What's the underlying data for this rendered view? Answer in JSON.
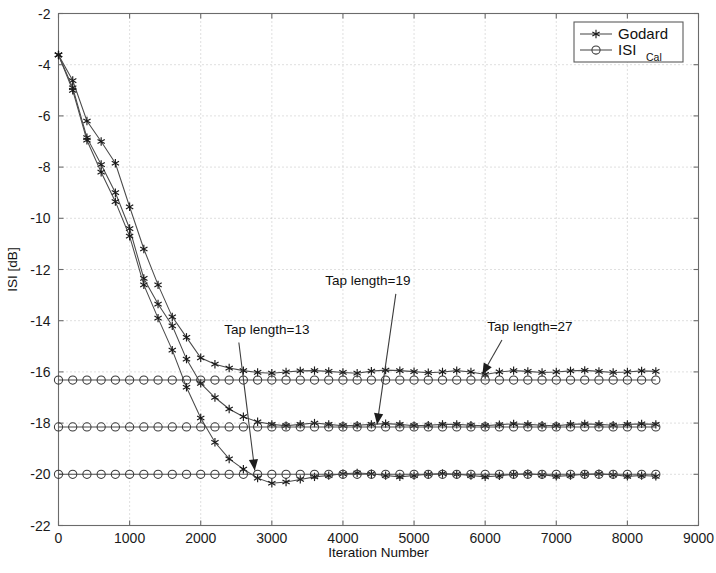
{
  "chart_data": {
    "type": "line",
    "title": "",
    "xlabel": "Iteration Number",
    "ylabel": "ISI [dB]",
    "xlim": [
      0,
      9000
    ],
    "ylim": [
      -22,
      -2
    ],
    "xticks": [
      0,
      1000,
      2000,
      3000,
      4000,
      5000,
      6000,
      7000,
      8000,
      9000
    ],
    "yticks": [
      -2,
      -4,
      -6,
      -8,
      -10,
      -12,
      -14,
      -16,
      -18,
      -20,
      -22
    ],
    "xtick_labels": [
      "0",
      "1000",
      "2000",
      "3000",
      "4000",
      "5000",
      "6000",
      "7000",
      "8000",
      "9000"
    ],
    "ytick_labels": [
      "-2",
      "-4",
      "-6",
      "-8",
      "-10",
      "-12",
      "-14",
      "-16",
      "-18",
      "-20",
      "-22"
    ],
    "grid": true,
    "grid_style": "dotted",
    "legend_position": "top-right",
    "legend": [
      {
        "name": "Godard",
        "marker": "star",
        "line": "solid"
      },
      {
        "name": "ISI",
        "subscript": "Cal",
        "marker": "circle",
        "line": "solid"
      }
    ],
    "annotations": [
      {
        "text": "Tap length=13",
        "text_x": 2930,
        "text_y": -14.5,
        "point_x": 2760,
        "point_y": -19.85
      },
      {
        "text": "Tap length=19",
        "text_x": 4350,
        "text_y": -12.6,
        "point_x": 4480,
        "point_y": -18.05
      },
      {
        "text": "Tap length=27",
        "text_x": 6630,
        "text_y": -14.4,
        "point_x": 5960,
        "point_y": -16.1
      }
    ],
    "series": [
      {
        "name": "Godard tap length 27",
        "marker": "star",
        "converged_level": -16.1,
        "x": [
          0,
          200,
          400,
          600,
          800,
          1000,
          1200,
          1400,
          1600,
          1800,
          2000,
          2200,
          2400,
          2600,
          2800,
          3000,
          3200,
          3400,
          3600,
          3800,
          4000,
          4200,
          4400,
          4600,
          4800,
          5000,
          5200,
          5400,
          5600,
          5800,
          6000,
          6200,
          6400,
          6600,
          6800,
          7000,
          7200,
          7400,
          7600,
          7800,
          8000,
          8200,
          8400
        ],
        "y": [
          -3.62,
          -4.62,
          -6.2,
          -7.0,
          -7.85,
          -9.55,
          -11.2,
          -12.6,
          -13.85,
          -14.65,
          -15.45,
          -15.7,
          -15.85,
          -15.95,
          -16.02,
          -16.05,
          -16.0,
          -15.96,
          -15.95,
          -15.98,
          -16.02,
          -16.05,
          -15.97,
          -15.93,
          -15.95,
          -15.99,
          -16.03,
          -16.0,
          -15.95,
          -16.0,
          -16.1,
          -16.0,
          -15.95,
          -15.98,
          -16.02,
          -16.0,
          -15.96,
          -15.94,
          -15.98,
          -16.02,
          -16.0,
          -15.96,
          -15.98
        ]
      },
      {
        "name": "Godard tap length 19",
        "marker": "star",
        "converged_level": -18.1,
        "x": [
          0,
          200,
          400,
          600,
          800,
          1000,
          1200,
          1400,
          1600,
          1800,
          2000,
          2200,
          2400,
          2600,
          2800,
          3000,
          3200,
          3400,
          3600,
          3800,
          4000,
          4200,
          4400,
          4600,
          4800,
          5000,
          5200,
          5400,
          5600,
          5800,
          6000,
          6200,
          6400,
          6600,
          6800,
          7000,
          7200,
          7400,
          7600,
          7800,
          8000,
          8200,
          8400
        ],
        "y": [
          -3.62,
          -4.9,
          -6.85,
          -7.9,
          -9.0,
          -10.4,
          -12.35,
          -13.35,
          -14.2,
          -15.5,
          -16.45,
          -17.0,
          -17.45,
          -17.75,
          -17.95,
          -18.05,
          -18.1,
          -18.05,
          -18.0,
          -18.05,
          -18.1,
          -18.08,
          -18.05,
          -18.02,
          -18.05,
          -18.1,
          -18.08,
          -18.05,
          -18.05,
          -18.08,
          -18.1,
          -18.06,
          -18.03,
          -18.05,
          -18.08,
          -18.1,
          -18.05,
          -18.03,
          -18.05,
          -18.08,
          -18.05,
          -18.03,
          -18.05
        ]
      },
      {
        "name": "Godard tap length 13",
        "marker": "star",
        "converged_level": -20.0,
        "x": [
          0,
          200,
          400,
          600,
          800,
          1000,
          1200,
          1400,
          1600,
          1800,
          2000,
          2200,
          2400,
          2600,
          2800,
          3000,
          3200,
          3400,
          3600,
          3800,
          4000,
          4200,
          4400,
          4600,
          4800,
          5000,
          5200,
          5400,
          5600,
          5800,
          6000,
          6200,
          6400,
          6600,
          6800,
          7000,
          7200,
          7400,
          7600,
          7800,
          8000,
          8200,
          8400
        ],
        "y": [
          -3.62,
          -5.0,
          -6.95,
          -8.2,
          -9.35,
          -10.7,
          -12.6,
          -13.9,
          -15.15,
          -16.6,
          -17.8,
          -18.75,
          -19.4,
          -19.8,
          -20.15,
          -20.35,
          -20.3,
          -20.2,
          -20.1,
          -20.05,
          -19.98,
          -19.95,
          -19.98,
          -20.05,
          -20.1,
          -20.05,
          -20.0,
          -19.97,
          -20.0,
          -20.05,
          -20.1,
          -20.06,
          -20.0,
          -19.98,
          -20.02,
          -20.08,
          -20.05,
          -20.0,
          -19.98,
          -20.02,
          -20.08,
          -20.05,
          -20.08
        ]
      },
      {
        "name": "ISI Cal tap length 27",
        "marker": "circle",
        "level": -16.32,
        "x": [
          0,
          200,
          400,
          600,
          800,
          1000,
          1200,
          1400,
          1600,
          1800,
          2000,
          2200,
          2400,
          2600,
          2800,
          3000,
          3200,
          3400,
          3600,
          3800,
          4000,
          4200,
          4400,
          4600,
          4800,
          5000,
          5200,
          5400,
          5600,
          5800,
          6000,
          6200,
          6400,
          6600,
          6800,
          7000,
          7200,
          7400,
          7600,
          7800,
          8000,
          8200,
          8400
        ],
        "y": [
          -16.32,
          -16.32,
          -16.32,
          -16.32,
          -16.32,
          -16.32,
          -16.32,
          -16.32,
          -16.32,
          -16.32,
          -16.32,
          -16.32,
          -16.32,
          -16.32,
          -16.32,
          -16.32,
          -16.32,
          -16.32,
          -16.32,
          -16.32,
          -16.32,
          -16.32,
          -16.32,
          -16.32,
          -16.32,
          -16.32,
          -16.32,
          -16.32,
          -16.32,
          -16.32,
          -16.32,
          -16.32,
          -16.32,
          -16.32,
          -16.32,
          -16.32,
          -16.32,
          -16.32,
          -16.32,
          -16.32,
          -16.32,
          -16.32,
          -16.32
        ]
      },
      {
        "name": "ISI Cal tap length 19",
        "marker": "circle",
        "level": -18.15,
        "x": [
          0,
          200,
          400,
          600,
          800,
          1000,
          1200,
          1400,
          1600,
          1800,
          2000,
          2200,
          2400,
          2600,
          2800,
          3000,
          3200,
          3400,
          3600,
          3800,
          4000,
          4200,
          4400,
          4600,
          4800,
          5000,
          5200,
          5400,
          5600,
          5800,
          6000,
          6200,
          6400,
          6600,
          6800,
          7000,
          7200,
          7400,
          7600,
          7800,
          8000,
          8200,
          8400
        ],
        "y": [
          -18.15,
          -18.15,
          -18.15,
          -18.15,
          -18.15,
          -18.15,
          -18.15,
          -18.15,
          -18.15,
          -18.15,
          -18.15,
          -18.15,
          -18.15,
          -18.15,
          -18.15,
          -18.15,
          -18.15,
          -18.15,
          -18.15,
          -18.15,
          -18.15,
          -18.15,
          -18.15,
          -18.15,
          -18.15,
          -18.15,
          -18.15,
          -18.15,
          -18.15,
          -18.15,
          -18.15,
          -18.15,
          -18.15,
          -18.15,
          -18.15,
          -18.15,
          -18.15,
          -18.15,
          -18.15,
          -18.15,
          -18.15,
          -18.15,
          -18.15
        ]
      },
      {
        "name": "ISI Cal tap length 13",
        "marker": "circle",
        "level": -20.0,
        "x": [
          0,
          200,
          400,
          600,
          800,
          1000,
          1200,
          1400,
          1600,
          1800,
          2000,
          2200,
          2400,
          2600,
          2800,
          3000,
          3200,
          3400,
          3600,
          3800,
          4000,
          4200,
          4400,
          4600,
          4800,
          5000,
          5200,
          5400,
          5600,
          5800,
          6000,
          6200,
          6400,
          6600,
          6800,
          7000,
          7200,
          7400,
          7600,
          7800,
          8000,
          8200,
          8400
        ],
        "y": [
          -20.0,
          -20.0,
          -20.0,
          -20.0,
          -20.0,
          -20.0,
          -20.0,
          -20.0,
          -20.0,
          -20.0,
          -20.0,
          -20.0,
          -20.0,
          -20.0,
          -20.0,
          -20.0,
          -20.0,
          -20.0,
          -20.0,
          -20.0,
          -20.0,
          -20.0,
          -20.0,
          -20.0,
          -20.0,
          -20.0,
          -20.0,
          -20.0,
          -20.0,
          -20.0,
          -20.0,
          -20.0,
          -20.0,
          -20.0,
          -20.0,
          -20.0,
          -20.0,
          -20.0,
          -20.0,
          -20.0,
          -20.0,
          -20.0,
          -20.0
        ]
      }
    ]
  }
}
